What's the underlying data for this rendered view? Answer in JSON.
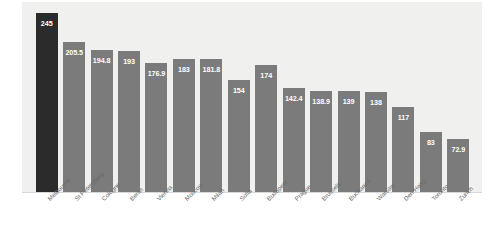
{
  "chart_data": {
    "type": "bar",
    "title": "",
    "subtitle": "",
    "xlabel": "",
    "ylabel": "",
    "ylim": [
      0,
      260
    ],
    "grid": false,
    "legend": null,
    "orientation": "vertical",
    "value_labels_inside_bars": true,
    "categories": [
      "Melbourne",
      "St Petersburg",
      "Cologne",
      "Berlin",
      "Vienna",
      "Moscow",
      "Milan",
      "Sofia",
      "Budapest",
      "Prague",
      "Brussels",
      "Bucharest",
      "Warsaw",
      "Den Haag",
      "Toronto",
      "Zurich"
    ],
    "values": [
      245,
      205.5,
      194.8,
      193,
      176.9,
      183,
      181.8,
      154,
      174,
      142.4,
      138.9,
      139,
      138,
      117,
      83,
      72.9
    ],
    "value_labels": [
      "245",
      "205.5",
      "194.8",
      "193",
      "176.9",
      "183",
      "181.8",
      "154",
      "174",
      "142.4",
      "138.9",
      "139",
      "138",
      "117",
      "83",
      "72.9"
    ],
    "highlight_index": 0,
    "colors": {
      "bar": "#7b7b7b",
      "bar_highlight": "#2b2b2b",
      "value_text": "#ffffff",
      "category_text": "#6a6a6a",
      "plot_background": "#f0f0ef",
      "page_background": "#ffffff"
    }
  }
}
